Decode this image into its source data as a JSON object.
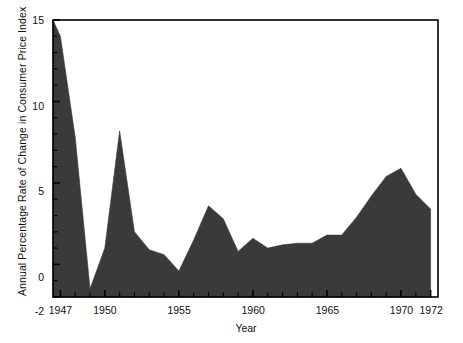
{
  "chart_data": {
    "type": "area",
    "title": "",
    "xlabel": "Year",
    "ylabel": "Annual Percentage Rate of Change in Consumer Price Index",
    "xlim": [
      1946.5,
      1972.5
    ],
    "ylim": [
      -2,
      15
    ],
    "grid": false,
    "legend": "none",
    "fill_color": "#3a3a3a",
    "axis_color": "#000000",
    "background_color": "#ffffff",
    "x_tick_labels": [
      "1947",
      "1950",
      "1955",
      "1960",
      "1965",
      "1970",
      "1972"
    ],
    "x_tick_values": [
      1947,
      1950,
      1955,
      1960,
      1965,
      1970,
      1972
    ],
    "x_minor_tick_interval": 1,
    "y_tick_labels": [
      "15",
      "10",
      "5",
      "0",
      "-2"
    ],
    "y_tick_values": [
      15,
      10,
      5,
      0,
      -2
    ],
    "y_minor_tick_interval": 1,
    "x": [
      1946.5,
      1947,
      1948,
      1949,
      1950,
      1951,
      1952,
      1953,
      1954,
      1955,
      1956,
      1957,
      1958,
      1959,
      1960,
      1961,
      1962,
      1963,
      1964,
      1965,
      1966,
      1967,
      1968,
      1969,
      1970,
      1971,
      1972
    ],
    "values": [
      15.0,
      14.0,
      7.8,
      -1.5,
      1.0,
      8.2,
      2.0,
      0.9,
      0.6,
      -0.4,
      1.5,
      3.6,
      2.8,
      0.8,
      1.6,
      1.0,
      1.2,
      1.3,
      1.3,
      1.8,
      1.8,
      2.9,
      4.2,
      5.4,
      5.9,
      4.3,
      3.4
    ],
    "series": [
      {
        "name": "Annual Percentage Rate of Change in Consumer Price Index",
        "values": [
          15.0,
          14.0,
          7.8,
          -1.5,
          1.0,
          8.2,
          2.0,
          0.9,
          0.6,
          -0.4,
          1.5,
          3.6,
          2.8,
          0.8,
          1.6,
          1.0,
          1.2,
          1.3,
          1.3,
          1.8,
          1.8,
          2.9,
          4.2,
          5.4,
          5.9,
          4.3,
          3.4
        ]
      }
    ]
  },
  "axis": {
    "y_title": "Annual Percentage Rate of Change in Consumer Price Index",
    "x_title": "Year",
    "y_ticks": [
      {
        "label": "15",
        "value": 15
      },
      {
        "label": "10",
        "value": 10
      },
      {
        "label": "5",
        "value": 5
      },
      {
        "label": "0",
        "value": 0
      },
      {
        "label": "-2",
        "value": -2
      }
    ],
    "x_ticks": [
      {
        "label": "1947",
        "value": 1947
      },
      {
        "label": "1950",
        "value": 1950
      },
      {
        "label": "1955",
        "value": 1955
      },
      {
        "label": "1960",
        "value": 1960
      },
      {
        "label": "1965",
        "value": 1965
      },
      {
        "label": "1970",
        "value": 1970
      },
      {
        "label": "1972",
        "value": 1972
      }
    ]
  }
}
